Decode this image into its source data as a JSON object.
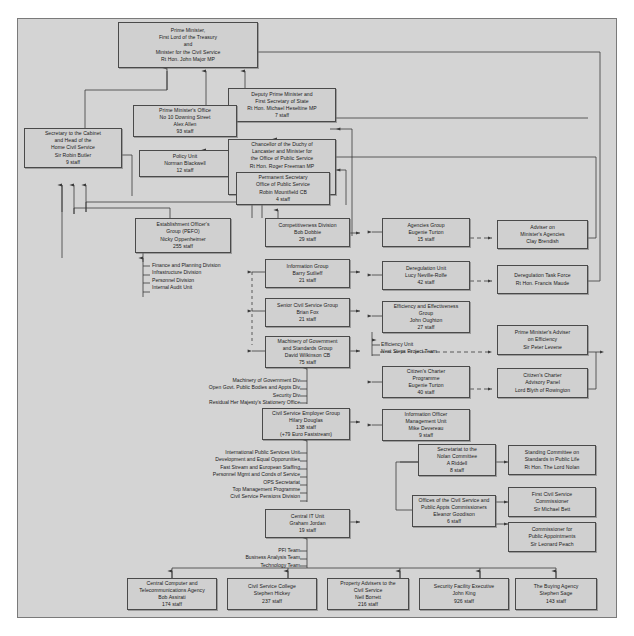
{
  "chart_meta": {
    "type": "org-chart",
    "title": "UK Government Civil Service / Office of Public Service organisation chart",
    "background_color": "#d4d4d4",
    "box_fill_color": "#d0d0d0",
    "box_border_color": "#4a4a4a",
    "line_color": "#3a3a3a"
  },
  "boxes": {
    "prime_minister": {
      "lines": [
        "Prime Minister,",
        "First Lord of the Treasury",
        "and",
        "Minister for the Civil Service",
        "Rt Hon. John Major MP"
      ]
    },
    "deputy_pm": {
      "lines": [
        "Deputy Prime Minister and",
        "First Secretary of State",
        "Rt Hon. Michael Heseltine MP",
        "7 staff"
      ]
    },
    "pm_office": {
      "lines": [
        "Prime Minister's Office",
        "No 10 Downing Street",
        "Alex Allen",
        "93 staff"
      ]
    },
    "secretary_cabinet": {
      "lines": [
        "Secretary to the Cabinet",
        "and Head of the",
        "Home Civil Service",
        "Sir Robin Butler",
        "9 staff"
      ]
    },
    "policy_unit": {
      "lines": [
        "Policy Unit",
        "Norman Blackwell",
        "12 staff"
      ]
    },
    "chancellor_duchy": {
      "lines": [
        "Chancellor of the Duchy of",
        "Lancaster and Minister for",
        "the Office of Public Service",
        "Rt Hon. Roger Freeman MP"
      ],
      "lines2": [
        "Paymaster General",
        "Michael Bates MP",
        "19 staff"
      ]
    },
    "permanent_secretary": {
      "lines": [
        "Permanent Secretary",
        "Office of Public Service",
        "Robin Mountfield CB",
        "4 staff"
      ]
    },
    "establishment_officer": {
      "lines": [
        "Establishment Officer's",
        "Group (PEFO)",
        "Nicky Oppenheimer",
        "255 staff"
      ]
    },
    "competitiveness_division": {
      "lines": [
        "Competitiveness Division",
        "Bob Dobbie",
        "29 staff"
      ]
    },
    "information_group": {
      "lines": [
        "Information Group",
        "Barry Sutlieff",
        "21 staff"
      ]
    },
    "senior_civil_service_group": {
      "lines": [
        "Senior Civil Service Group",
        "Brian Fox",
        "21 staff"
      ]
    },
    "machinery_of_government": {
      "lines": [
        "Machinery of Government",
        "and Standards Group",
        "David Wilkinson CB",
        "75 staff"
      ]
    },
    "civil_service_employer_group": {
      "lines": [
        "Civil Service Employer Group",
        "Hilary Douglas",
        "138 staff",
        "(+79 Euro Faststream)"
      ]
    },
    "central_it_unit": {
      "lines": [
        "Central IT Unit",
        "Graham Jordan",
        "19 staff"
      ]
    },
    "agencies_group": {
      "lines": [
        "Agencies Group",
        "Eugenie Turton",
        "15 staff"
      ]
    },
    "deregulation_unit": {
      "lines": [
        "Deregulation Unit",
        "Lucy Neville-Rolfe",
        "42 staff"
      ]
    },
    "efficiency_effectiveness_group": {
      "lines": [
        "Efficiency and Effectiveness",
        "Group",
        "John Oughton",
        "27 staff"
      ]
    },
    "citizens_charter_programme": {
      "lines": [
        "Citizen's Charter",
        "Programme",
        "Eugenie Turton",
        "40 staff"
      ]
    },
    "information_officer_mgmt_unit": {
      "lines": [
        "Information Officer",
        "Management Unit",
        "Mike Devereau",
        "9 staff"
      ]
    },
    "nolan_secretariat": {
      "lines": [
        "Secretariat to the",
        "Nolan Committee",
        "A Riddell",
        "8 staff"
      ]
    },
    "offices_commissioners": {
      "lines": [
        "Offices of the Civil Service and",
        "Public Appts Commissioners",
        "Eleanor Goodison",
        "6 staff"
      ]
    },
    "adviser_ministers_agencies": {
      "lines": [
        "Adviser on",
        "Minister's Agencies",
        "Clay Brendish"
      ]
    },
    "deregulation_task_force": {
      "lines": [
        "Deregulation Task Force",
        "Rt Hon. Francis Maude"
      ]
    },
    "pm_adviser_efficiency": {
      "lines": [
        "Prime Minister's Adviser",
        "on Efficiency",
        "Sir Peter Levene"
      ]
    },
    "citizens_charter_advisory_panel": {
      "lines": [
        "Citizen's Charter",
        "Advisory Panel",
        "Lord Blyth of Rowington"
      ]
    },
    "standing_committee_nolan": {
      "lines": [
        "Standing Committee on",
        "Standards in Public Life",
        "Rt Hon. The Lord Nolan"
      ]
    },
    "first_civil_service_commissioner": {
      "lines": [
        "First Civil Service",
        "Commissioner",
        "Sir Michael Bett"
      ]
    },
    "commissioner_public_appointments": {
      "lines": [
        "Commissioner for",
        "Public Appointments",
        "Sir Leonard Peach"
      ]
    },
    "ccta": {
      "lines": [
        "Central Computer and",
        "Telecommunications Agency",
        "Bob Assirati",
        "174 staff"
      ]
    },
    "civil_service_college": {
      "lines": [
        "Civil Service College",
        "Stephen Hickey",
        "237 staff"
      ]
    },
    "property_advisers": {
      "lines": [
        "Property Advisers to the",
        "Civil Service",
        "Neil Borrett",
        "216 staff"
      ]
    },
    "security_facility_executive": {
      "lines": [
        "Security Facility Executive",
        "John King",
        "926 staff"
      ]
    },
    "buying_agency": {
      "lines": [
        "The Buying Agency",
        "Stephen Sage",
        "143 staff"
      ]
    }
  },
  "sublists": {
    "pefo_divisions": {
      "items": [
        "Finance and Planning Division",
        "Infrastructure Division",
        "Personnel Division",
        "Internal Audit Unit"
      ]
    },
    "mog_divisions": {
      "items": [
        "Machinery of Government Div",
        "Open Govt. Public Bodies and Appts Div",
        "Security Div",
        "Residual Her Majesty's Stationery Office"
      ]
    },
    "csel_divisions": {
      "items": [
        "International Public Services Unit",
        "Development and Equal Opporunities",
        "Fast Stream and European Staffing",
        "Personnel Mgmt and Conds of Service",
        "OPS Secretariat",
        "Top Management Programme",
        "Civil Service Pensions Division"
      ]
    },
    "citu_teams": {
      "items": [
        "PFI Team",
        "Business Analysis Team",
        "Technology Team"
      ]
    },
    "efficiency_units": {
      "items": [
        "Efficiency Unit",
        "Next Steps Project Team"
      ]
    }
  }
}
